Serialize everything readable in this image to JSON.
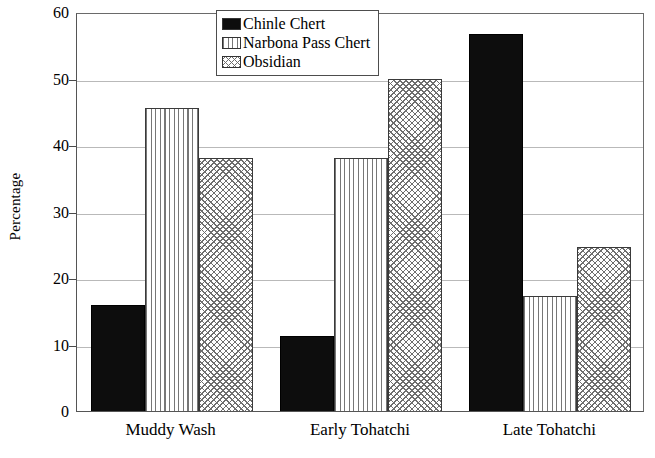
{
  "chart_data": {
    "type": "bar",
    "title": "",
    "xlabel": "",
    "ylabel": "Percentage",
    "ylim": [
      0,
      60
    ],
    "yticks": [
      0,
      10,
      20,
      30,
      40,
      50,
      60
    ],
    "ytick_labels": [
      "0",
      "10",
      "20",
      "30",
      "40",
      "50",
      "60"
    ],
    "grid": true,
    "legend_position": "top-center",
    "categories": [
      "Muddy Wash",
      "Early Tohatchi",
      "Late Tohatchi"
    ],
    "series": [
      {
        "name": "Chinle Chert",
        "pattern": "solid-black",
        "values": [
          16.0,
          11.3,
          56.7
        ]
      },
      {
        "name": "Narbona Pass Chert",
        "pattern": "vertical-lines",
        "values": [
          45.5,
          38.0,
          17.3
        ]
      },
      {
        "name": "Obsidian",
        "pattern": "cross-hatch",
        "values": [
          38.0,
          50.0,
          24.7
        ]
      }
    ],
    "colors": {
      "chinle_chert": "#0d0d0d",
      "narbona_pass_chert": "#777777",
      "obsidian": "#6e6e6e",
      "axis": "#555555",
      "gridline": "#b9b9b9",
      "background": "#ffffff"
    }
  }
}
